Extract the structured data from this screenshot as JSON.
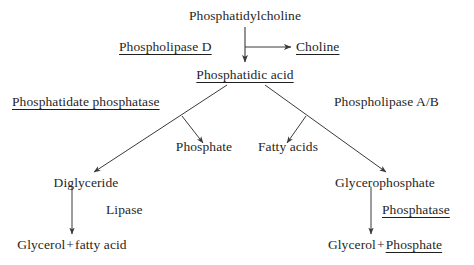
{
  "diagram": {
    "type": "metabolic-pathway-flowchart",
    "background_color": "#ffffff",
    "text_color": "#1f1f1f",
    "line_color": "#3a3a3a",
    "nodes": {
      "substrate": "Phosphatidylcholine",
      "enzyme_phospholipase_d": "Phospholipase D",
      "product_choline": "Choline",
      "intermediate_phosphatidic_acid": "Phosphatidic acid",
      "enzyme_phosphatidate_phosphatase": "Phosphatidate phosphatase",
      "enzyme_phospholipase_ab": "Phospholipase A/B",
      "product_phosphate": "Phosphate",
      "product_fatty_acids": "Fatty acids",
      "intermediate_diglyceride": "Diglyceride",
      "intermediate_glycerophosphate": "Glycerophosphate",
      "enzyme_lipase": "Lipase",
      "enzyme_phosphatase": "Phosphatase",
      "product_glycerol_left": "Glycerol",
      "product_plus_left": "+",
      "product_fatty_acid_left": "fatty acid",
      "product_glycerol_right": "Glycerol",
      "product_plus_right": "+",
      "product_phosphate_right": "Phosphate"
    }
  }
}
